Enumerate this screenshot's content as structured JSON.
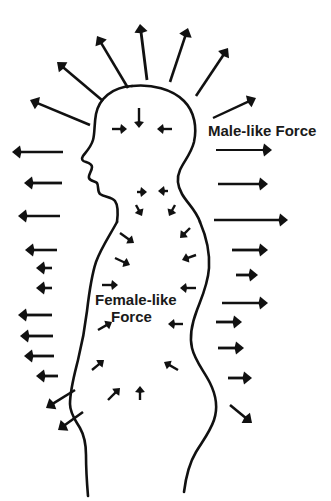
{
  "figure": {
    "background_color": "#ffffff",
    "ink_color": "#111111",
    "width": 331,
    "height": 501
  },
  "labels": {
    "male_force": "Male-like Force",
    "female_force_line1": "Female-like",
    "female_force_line2": "Force"
  },
  "chart_data": {
    "type": "diagram",
    "legend": [
      {
        "name": "Male-like Force",
        "direction": "outward",
        "location": "outside body"
      },
      {
        "name": "Female-like Force",
        "direction": "inward",
        "location": "inside body"
      }
    ],
    "outward_arrows_count": 28,
    "inward_arrows_count": 19,
    "outward_arrows": [
      {
        "x1": 128,
        "y1": 88,
        "x2": 97,
        "y2": 36,
        "width": 2.6,
        "head": 8
      },
      {
        "x1": 147,
        "y1": 80,
        "x2": 140,
        "y2": 24,
        "width": 2.8,
        "head": 8
      },
      {
        "x1": 170,
        "y1": 82,
        "x2": 188,
        "y2": 28,
        "width": 2.6,
        "head": 8
      },
      {
        "x1": 196,
        "y1": 96,
        "x2": 228,
        "y2": 48,
        "width": 2.6,
        "head": 8
      },
      {
        "x1": 103,
        "y1": 101,
        "x2": 57,
        "y2": 62,
        "width": 2.6,
        "head": 8
      },
      {
        "x1": 90,
        "y1": 125,
        "x2": 30,
        "y2": 100,
        "width": 2.6,
        "head": 8
      },
      {
        "x1": 213,
        "y1": 118,
        "x2": 256,
        "y2": 98,
        "width": 2.4,
        "head": 8
      },
      {
        "x1": 63,
        "y1": 152,
        "x2": 12,
        "y2": 152,
        "width": 2.4,
        "head": 8
      },
      {
        "x1": 62,
        "y1": 183,
        "x2": 24,
        "y2": 183,
        "width": 2.8,
        "head": 8
      },
      {
        "x1": 60,
        "y1": 216,
        "x2": 18,
        "y2": 216,
        "width": 2.6,
        "head": 8
      },
      {
        "x1": 57,
        "y1": 250,
        "x2": 25,
        "y2": 250,
        "width": 2.6,
        "head": 8
      },
      {
        "x1": 52,
        "y1": 268,
        "x2": 36,
        "y2": 268,
        "width": 2.6,
        "head": 8
      },
      {
        "x1": 52,
        "y1": 288,
        "x2": 36,
        "y2": 288,
        "width": 2.6,
        "head": 8
      },
      {
        "x1": 52,
        "y1": 315,
        "x2": 18,
        "y2": 315,
        "width": 2.8,
        "head": 8
      },
      {
        "x1": 53,
        "y1": 336,
        "x2": 20,
        "y2": 336,
        "width": 2.8,
        "head": 8
      },
      {
        "x1": 54,
        "y1": 356,
        "x2": 24,
        "y2": 356,
        "width": 2.8,
        "head": 8
      },
      {
        "x1": 58,
        "y1": 376,
        "x2": 36,
        "y2": 376,
        "width": 2.8,
        "head": 8
      },
      {
        "x1": 75,
        "y1": 390,
        "x2": 46,
        "y2": 408,
        "width": 2.6,
        "head": 8
      },
      {
        "x1": 83,
        "y1": 412,
        "x2": 58,
        "y2": 430,
        "width": 2.6,
        "head": 8
      },
      {
        "x1": 216,
        "y1": 150,
        "x2": 272,
        "y2": 150,
        "width": 2.2,
        "head": 8
      },
      {
        "x1": 218,
        "y1": 184,
        "x2": 268,
        "y2": 184,
        "width": 2.6,
        "head": 8
      },
      {
        "x1": 214,
        "y1": 220,
        "x2": 288,
        "y2": 220,
        "width": 2.6,
        "head": 8
      },
      {
        "x1": 232,
        "y1": 250,
        "x2": 268,
        "y2": 250,
        "width": 2.8,
        "head": 8
      },
      {
        "x1": 236,
        "y1": 275,
        "x2": 258,
        "y2": 275,
        "width": 2.8,
        "head": 8
      },
      {
        "x1": 222,
        "y1": 303,
        "x2": 268,
        "y2": 303,
        "width": 2.6,
        "head": 8
      },
      {
        "x1": 216,
        "y1": 322,
        "x2": 242,
        "y2": 322,
        "width": 2.8,
        "head": 8
      },
      {
        "x1": 218,
        "y1": 348,
        "x2": 244,
        "y2": 348,
        "width": 2.8,
        "head": 8
      },
      {
        "x1": 228,
        "y1": 378,
        "x2": 252,
        "y2": 378,
        "width": 2.8,
        "head": 8
      },
      {
        "x1": 230,
        "y1": 405,
        "x2": 252,
        "y2": 423,
        "width": 2.6,
        "head": 8
      }
    ],
    "inward_arrows": [
      {
        "x1": 139,
        "y1": 108,
        "x2": 139,
        "y2": 128,
        "width": 2.4,
        "head": 6
      },
      {
        "x1": 112,
        "y1": 129,
        "x2": 127,
        "y2": 129,
        "width": 2.4,
        "head": 6
      },
      {
        "x1": 172,
        "y1": 129,
        "x2": 157,
        "y2": 129,
        "width": 2.4,
        "head": 6
      },
      {
        "x1": 137,
        "y1": 192,
        "x2": 147,
        "y2": 192,
        "width": 2.4,
        "head": 6
      },
      {
        "x1": 168,
        "y1": 191,
        "x2": 158,
        "y2": 191,
        "width": 2.4,
        "head": 6
      },
      {
        "x1": 136,
        "y1": 205,
        "x2": 142,
        "y2": 216,
        "width": 2.4,
        "head": 6
      },
      {
        "x1": 175,
        "y1": 205,
        "x2": 169,
        "y2": 216,
        "width": 2.4,
        "head": 6
      },
      {
        "x1": 120,
        "y1": 233,
        "x2": 134,
        "y2": 243,
        "width": 2.4,
        "head": 6
      },
      {
        "x1": 190,
        "y1": 228,
        "x2": 180,
        "y2": 238,
        "width": 2.4,
        "head": 6
      },
      {
        "x1": 115,
        "y1": 258,
        "x2": 130,
        "y2": 265,
        "width": 2.4,
        "head": 6
      },
      {
        "x1": 196,
        "y1": 255,
        "x2": 182,
        "y2": 260,
        "width": 2.4,
        "head": 6
      },
      {
        "x1": 102,
        "y1": 285,
        "x2": 118,
        "y2": 285,
        "width": 2.4,
        "head": 6
      },
      {
        "x1": 196,
        "y1": 288,
        "x2": 180,
        "y2": 288,
        "width": 2.4,
        "head": 6
      },
      {
        "x1": 98,
        "y1": 330,
        "x2": 112,
        "y2": 322,
        "width": 2.4,
        "head": 6
      },
      {
        "x1": 183,
        "y1": 324,
        "x2": 168,
        "y2": 324,
        "width": 2.4,
        "head": 6
      },
      {
        "x1": 92,
        "y1": 370,
        "x2": 104,
        "y2": 360,
        "width": 2.4,
        "head": 6
      },
      {
        "x1": 178,
        "y1": 370,
        "x2": 164,
        "y2": 362,
        "width": 2.4,
        "head": 6
      },
      {
        "x1": 108,
        "y1": 400,
        "x2": 120,
        "y2": 388,
        "width": 2.4,
        "head": 6
      },
      {
        "x1": 140,
        "y1": 400,
        "x2": 140,
        "y2": 386,
        "width": 2.4,
        "head": 6
      }
    ]
  }
}
